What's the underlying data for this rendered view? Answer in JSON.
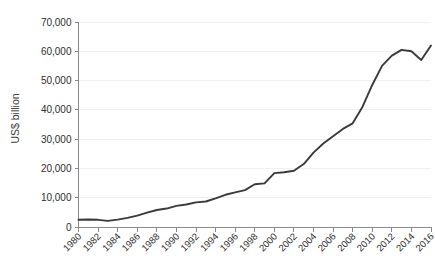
{
  "chart_data": {
    "type": "line",
    "title": "",
    "subtitle": "",
    "xlabel": "",
    "ylabel": "US$ billion",
    "xlim": [
      1980,
      2016
    ],
    "ylim": [
      0,
      70000
    ],
    "ytick_values": [
      0,
      10000,
      20000,
      30000,
      40000,
      50000,
      60000,
      70000
    ],
    "ytick_labels": [
      "0",
      "10,000",
      "20,000",
      "30,000",
      "40,000",
      "50,000",
      "60,000",
      "70,000"
    ],
    "xtick_values": [
      1980,
      1982,
      1984,
      1986,
      1988,
      1990,
      1992,
      1994,
      1996,
      1998,
      2000,
      2002,
      2004,
      2006,
      2008,
      2010,
      2012,
      2014,
      2016
    ],
    "xtick_labels": [
      "1980",
      "1982",
      "1984",
      "1986",
      "1988",
      "1990",
      "1992",
      "1994",
      "1996",
      "1998",
      "2000",
      "2002",
      "2004",
      "2006",
      "2008",
      "2010",
      "2012",
      "2014",
      "2016"
    ],
    "xtick_rotation": 45,
    "grid": "horizontal-faint",
    "legend": "none",
    "line_color": "#3a3a3a",
    "axis_color": "#8a8a8a",
    "grid_color": "#f0f0f2",
    "background_color": "#ffffff",
    "series": [
      {
        "name": "US$ billion",
        "x": [
          1980,
          1981,
          1982,
          1983,
          1984,
          1985,
          1986,
          1987,
          1988,
          1989,
          1990,
          1991,
          1992,
          1993,
          1994,
          1995,
          1996,
          1997,
          1998,
          1999,
          2000,
          2001,
          2002,
          2003,
          2004,
          2005,
          2006,
          2007,
          2008,
          2009,
          2010,
          2011,
          2012,
          2013,
          2014,
          2015,
          2016
        ],
        "values": [
          2500,
          2550,
          2450,
          2100,
          2500,
          3100,
          3900,
          4900,
          5800,
          6300,
          7200,
          7700,
          8400,
          8700,
          9800,
          11000,
          11800,
          12600,
          14600,
          14900,
          18400,
          18700,
          19200,
          21500,
          25400,
          28500,
          31000,
          33500,
          35400,
          41000,
          48500,
          55000,
          58500,
          60500,
          60000,
          57000,
          62000
        ]
      }
    ],
    "annotations": []
  }
}
